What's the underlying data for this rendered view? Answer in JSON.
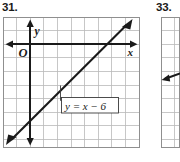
{
  "page": {
    "background_color": "#ffffff",
    "ink_color": "#1a1a1a",
    "grid_color": "#b9b9b9",
    "grid_border_color": "#8f8f8f"
  },
  "problems": [
    {
      "id": "31",
      "number_label": "31.",
      "figure": {
        "type": "coordinate-grid-line-graph",
        "grid": {
          "columns": 10,
          "rows": 9,
          "cell_size_px": 13.6,
          "show_border": true
        },
        "axes": {
          "x_label": "x",
          "y_label": "y",
          "origin_label": "O",
          "origin_cell": {
            "col": 2,
            "row": 2
          },
          "x_arrow_both_ends": true,
          "y_arrow_both_ends": true
        },
        "line": {
          "equation_label": "y = x − 6",
          "slope": 1,
          "y_intercept": -6,
          "arrow_start": true,
          "arrow_end": true
        },
        "callout": {
          "text": "y = x − 6",
          "has_leader_line": true
        }
      }
    },
    {
      "id": "33",
      "number_label": "33.",
      "figure": {
        "type": "coordinate-grid-line-graph-cropped",
        "grid": {
          "columns": 1,
          "rows": 9,
          "cell_size_px": 13.6,
          "show_border": true
        },
        "line": {
          "arrow_start": true
        }
      }
    }
  ]
}
